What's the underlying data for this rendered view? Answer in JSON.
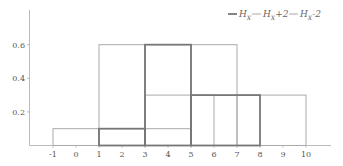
{
  "chart_data": {
    "type": "histogram",
    "title": "",
    "xlabel": "",
    "ylabel": "",
    "xlim": [
      -1.5,
      11
    ],
    "ylim": [
      0,
      0.65
    ],
    "x_ticks": [
      -1,
      0,
      1,
      2,
      3,
      4,
      5,
      6,
      7,
      8,
      9,
      10
    ],
    "y_ticks": [
      0.2,
      0.4,
      0.6
    ],
    "y_tick_labels": [
      "0.2",
      "0.4",
      "0.6"
    ],
    "grid": false,
    "legend_position": "top-right",
    "series": [
      {
        "name": "H_X",
        "style": "thick",
        "color": "#777777",
        "bins": [
          {
            "x0": 1,
            "x1": 3,
            "value": 0.1
          },
          {
            "x0": 3,
            "x1": 5,
            "value": 0.6
          },
          {
            "x0": 5,
            "x1": 8,
            "value": 0.3
          }
        ]
      },
      {
        "name": "H_X+2",
        "style": "thin",
        "color": "#aaaaaa",
        "bins": [
          {
            "x0": 3,
            "x1": 5,
            "value": 0.1
          },
          {
            "x0": 5,
            "x1": 7,
            "value": 0.6
          },
          {
            "x0": 7,
            "x1": 10,
            "value": 0.3
          }
        ]
      },
      {
        "name": "H_X-2",
        "style": "thin",
        "color": "#aaaaaa",
        "bins": [
          {
            "x0": -1,
            "x1": 1,
            "value": 0.1
          },
          {
            "x0": 1,
            "x1": 3,
            "value": 0.6
          },
          {
            "x0": 3,
            "x1": 6,
            "value": 0.3
          }
        ]
      }
    ]
  },
  "legend": {
    "items": [
      {
        "main": "H",
        "sub": "X",
        "suffix": ""
      },
      {
        "main": "H",
        "sub": "X",
        "suffix": "+2"
      },
      {
        "main": "H",
        "sub": "X",
        "suffix": "-2"
      }
    ]
  }
}
